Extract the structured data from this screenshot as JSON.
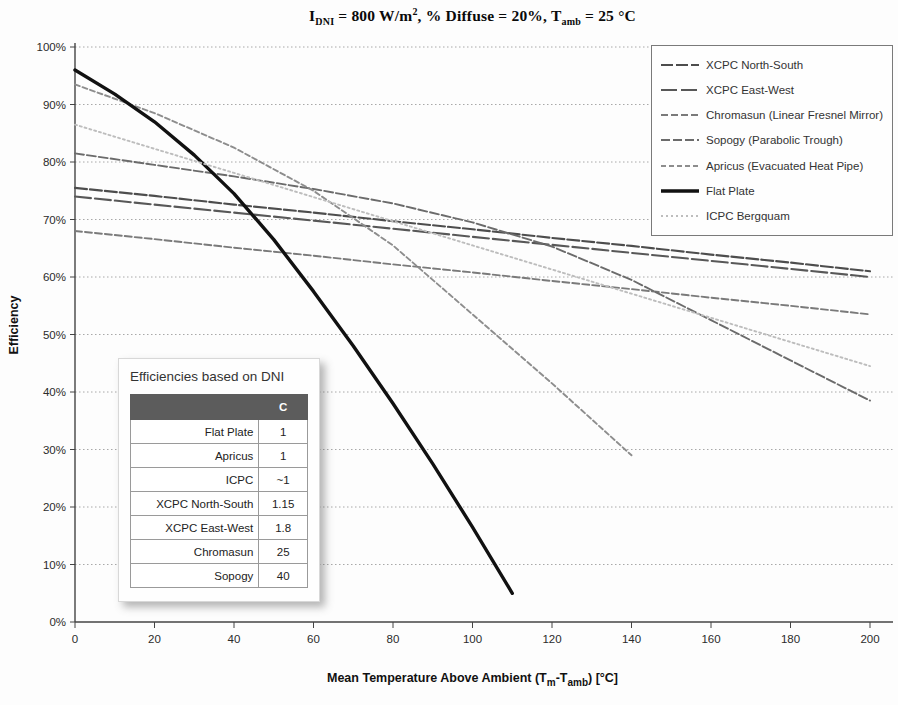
{
  "title_segments": [
    {
      "t": "I"
    },
    {
      "t": "DNI",
      "sub": true
    },
    {
      "t": " = 800 W/m"
    },
    {
      "t": "2",
      "sup": true
    },
    {
      "t": ", % Diffuse = 20%, T"
    },
    {
      "t": "amb",
      "sub": true
    },
    {
      "t": " = 25 °C"
    }
  ],
  "yaxis": {
    "title": "Efficiency",
    "tick_labels": [
      "0%",
      "10%",
      "20%",
      "30%",
      "40%",
      "50%",
      "60%",
      "70%",
      "80%",
      "90%",
      "100%"
    ]
  },
  "xaxis": {
    "title_segments": [
      {
        "t": "Mean Temperature Above Ambient (T"
      },
      {
        "t": "m",
        "sub": true
      },
      {
        "t": "-T"
      },
      {
        "t": "amb",
        "sub": true
      },
      {
        "t": ") [°C]"
      }
    ],
    "tick_labels": [
      "0",
      "20",
      "40",
      "60",
      "80",
      "100",
      "120",
      "140",
      "160",
      "180",
      "200"
    ]
  },
  "legend": [
    {
      "label": "XCPC North-South",
      "series": "xcpc_ns"
    },
    {
      "label": "XCPC East-West",
      "series": "xcpc_ew"
    },
    {
      "label": "Chromasun (Linear Fresnel Mirror)",
      "series": "chromasun"
    },
    {
      "label": "Sopogy (Parabolic Trough)",
      "series": "sopogy"
    },
    {
      "label": "Apricus (Evacuated Heat Pipe)",
      "series": "apricus"
    },
    {
      "label": "Flat Plate",
      "series": "flat_plate"
    },
    {
      "label": "ICPC Bergquam",
      "series": "icpc"
    }
  ],
  "inset_table": {
    "title": "Efficiencies based on DNI",
    "header": [
      "",
      "C"
    ],
    "rows": [
      [
        "Flat Plate",
        "1"
      ],
      [
        "Apricus",
        "1"
      ],
      [
        "ICPC",
        "~1"
      ],
      [
        "XCPC North-South",
        "1.15"
      ],
      [
        "XCPC East-West",
        "1.8"
      ],
      [
        "Chromasun",
        "25"
      ],
      [
        "Sopogy",
        "40"
      ]
    ]
  },
  "chart_data": {
    "type": "line",
    "xlabel": "Mean Temperature Above Ambient (Tm-Tamb) [°C]",
    "ylabel": "Efficiency",
    "xlim": [
      0,
      200
    ],
    "ylim_percent": [
      0,
      100
    ],
    "x_ticks": [
      0,
      20,
      40,
      60,
      80,
      100,
      120,
      140,
      160,
      180,
      200
    ],
    "y_ticks_percent": [
      0,
      10,
      20,
      30,
      40,
      50,
      60,
      70,
      80,
      90,
      100
    ],
    "grid": "horizontal-dotted",
    "legend_position": "top-right",
    "series": [
      {
        "id": "xcpc_ns",
        "name": "XCPC North-South",
        "color": "#4d4d4d",
        "width": 2.1,
        "dash": "12,3",
        "x": [
          0,
          20,
          40,
          60,
          80,
          100,
          120,
          140,
          160,
          180,
          200
        ],
        "y": [
          75.5,
          74.1,
          72.6,
          71.2,
          69.7,
          68.3,
          66.8,
          65.4,
          63.9,
          62.5,
          61
        ]
      },
      {
        "id": "xcpc_ew",
        "name": "XCPC East-West",
        "color": "#585858",
        "width": 2.1,
        "dash": "16,4",
        "x": [
          0,
          20,
          40,
          60,
          80,
          100,
          120,
          140,
          160,
          180,
          200
        ],
        "y": [
          74,
          72.6,
          71.2,
          69.8,
          68.4,
          67,
          65.6,
          64.2,
          62.8,
          61.4,
          60
        ]
      },
      {
        "id": "chromasun",
        "name": "Chromasun (Linear Fresnel Mirror)",
        "color": "#7a7a7a",
        "width": 1.9,
        "dash": "7,3",
        "x": [
          0,
          20,
          40,
          60,
          80,
          100,
          120,
          140,
          160,
          180,
          200
        ],
        "y": [
          68,
          66.6,
          65.1,
          63.7,
          62.2,
          60.8,
          59.3,
          57.9,
          56.4,
          55,
          53.5
        ]
      },
      {
        "id": "sopogy",
        "name": "Sopogy (Parabolic Trough)",
        "color": "#6b6b6b",
        "width": 1.9,
        "dash": "9,3",
        "x": [
          0,
          20,
          40,
          60,
          80,
          100,
          120,
          140,
          160,
          180,
          200
        ],
        "y": [
          81.5,
          79.5,
          77.5,
          75.3,
          72.8,
          69.5,
          65.3,
          59.5,
          52.5,
          45.5,
          38.5
        ]
      },
      {
        "id": "apricus",
        "name": "Apricus (Evacuated Heat Pipe)",
        "color": "#8d8d8d",
        "width": 1.9,
        "dash": "5,3",
        "x": [
          0,
          20,
          40,
          60,
          80,
          100,
          120,
          140
        ],
        "y": [
          93.5,
          88.5,
          82.5,
          75,
          65.5,
          53.5,
          41.5,
          29
        ]
      },
      {
        "id": "flat_plate",
        "name": "Flat Plate",
        "color": "#111111",
        "width": 3.4,
        "dash": "",
        "x": [
          0,
          10,
          20,
          30,
          40,
          50,
          60,
          70,
          80,
          90,
          100,
          110
        ],
        "y": [
          96,
          91.8,
          87,
          81.2,
          74.5,
          66.5,
          57.5,
          48,
          38,
          27.5,
          16.5,
          5
        ]
      },
      {
        "id": "icpc",
        "name": "ICPC Bergquam",
        "color": "#bdbdbd",
        "width": 1.9,
        "dash": "2,3",
        "x": [
          0,
          20,
          40,
          60,
          80,
          100,
          120,
          140,
          160,
          180,
          200
        ],
        "y": [
          86.5,
          82.3,
          78.1,
          73.9,
          69.7,
          65.5,
          61.3,
          57.1,
          52.9,
          48.7,
          44.5
        ]
      }
    ]
  }
}
